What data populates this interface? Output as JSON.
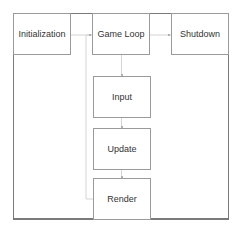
{
  "diagram": {
    "nodes": [
      {
        "id": "initialization",
        "label": "Initialization"
      },
      {
        "id": "game-loop",
        "label": "Game Loop"
      },
      {
        "id": "shutdown",
        "label": "Shutdown"
      },
      {
        "id": "input",
        "label": "Input"
      },
      {
        "id": "update",
        "label": "Update"
      },
      {
        "id": "render",
        "label": "Render"
      }
    ],
    "edges": [
      {
        "from": "initialization",
        "to": "game-loop"
      },
      {
        "from": "game-loop",
        "to": "shutdown"
      },
      {
        "from": "game-loop",
        "to": "input"
      },
      {
        "from": "input",
        "to": "update"
      },
      {
        "from": "update",
        "to": "render"
      },
      {
        "from": "render",
        "to": "game-loop",
        "style": "loop-back"
      }
    ],
    "colors": {
      "border": "#9a9a9a",
      "frame": "#7a7a7a",
      "connector": "#d0d0d0",
      "text": "#333333"
    }
  }
}
